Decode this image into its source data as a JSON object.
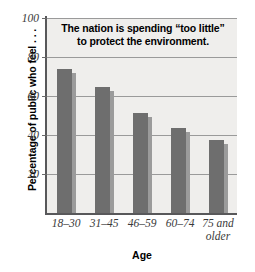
{
  "chart_data": {
    "type": "bar",
    "title": "The nation is spending “too little” to protect the environment.",
    "title_lines": [
      "The nation is spending “too little”",
      "to protect the environment."
    ],
    "categories": [
      "18–30",
      "31–45",
      "46–59",
      "75 and older",
      "60–74"
    ],
    "category_labels": [
      {
        "line1": "18–30",
        "line2": ""
      },
      {
        "line1": "31–45",
        "line2": ""
      },
      {
        "line1": "46–59",
        "line2": ""
      },
      {
        "line1": "60–74",
        "line2": ""
      },
      {
        "line1": "75 and",
        "line2": "older"
      }
    ],
    "values": [
      74,
      64.5,
      51.5,
      43.5,
      37.5
    ],
    "xlabel": "Age",
    "ylabel": "Percentage of public who feel . . .",
    "ylim": [
      0,
      100
    ],
    "yticks": [
      20,
      40,
      60,
      80,
      100
    ],
    "ytick_labels": [
      "20",
      "40",
      "60",
      "80",
      "100"
    ],
    "grid": true,
    "legend": "none",
    "colors": {
      "bar_face": "#6e6e6e",
      "bar_side": "#9b9b9b",
      "plot_background": "#efeeec",
      "gridline": "#9a9a9a",
      "axis": "#58585a",
      "text": "#000000",
      "tick_text": "#3a3a3a"
    }
  }
}
